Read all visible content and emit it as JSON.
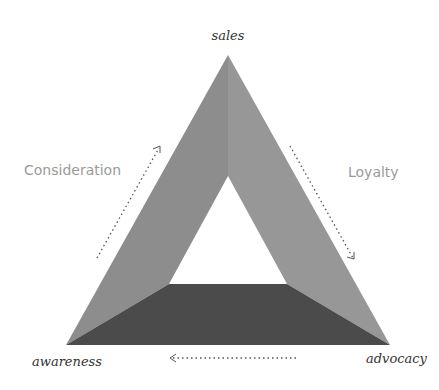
{
  "diagram": {
    "type": "triangle-cycle",
    "vertices": {
      "top": "sales",
      "bottom_left": "awareness",
      "bottom_right": "advocacy"
    },
    "stages": {
      "left": "Consideration",
      "right": "Loyalty"
    },
    "flow": [
      {
        "from": "awareness",
        "to": "sales",
        "via": "Consideration",
        "style": "dotted-arrow"
      },
      {
        "from": "sales",
        "to": "advocacy",
        "via": "Loyalty",
        "style": "dotted-arrow"
      },
      {
        "from": "advocacy",
        "to": "awareness",
        "style": "dotted-arrow"
      }
    ],
    "colors": {
      "left_face": "#8f8f8f",
      "right_face": "#969696",
      "bottom_face": "#4a4a4a",
      "stage_label": "#9a9a9a",
      "vertex_label": "#333333",
      "arrow": "#555555"
    }
  }
}
